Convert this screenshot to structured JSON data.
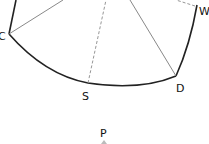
{
  "diagram": {
    "type": "geometry-sector",
    "colors": {
      "boundary": "#222222",
      "ray": "#7a7a7a",
      "dashed": "#8a8a8a",
      "text": "#111111"
    },
    "points": {
      "C": {
        "label": "C",
        "x": 9,
        "y": 34
      },
      "S": {
        "label": "S",
        "x": 88,
        "y": 83
      },
      "D": {
        "label": "D",
        "x": 176,
        "y": 76
      },
      "W": {
        "label": "W",
        "x": 195,
        "y": 6
      },
      "P": {
        "label": "P",
        "x": 104,
        "y": 143
      }
    },
    "labels": {
      "C": "C",
      "S": "S",
      "D": "D",
      "W": "W",
      "P": "P"
    }
  }
}
